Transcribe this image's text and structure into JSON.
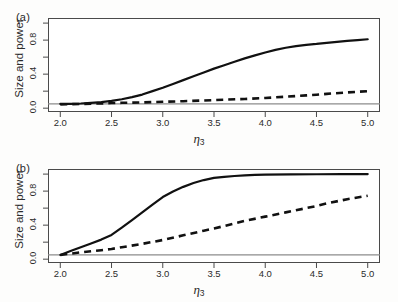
{
  "figure": {
    "background": "#fdfdfc",
    "axis_color": "#4a4a4a",
    "curve_color": "#111111",
    "reference_line_color": "#8c8c8c"
  },
  "chart_data": [
    {
      "type": "line",
      "panel": "(a)",
      "title": "",
      "xlabel": "η₃",
      "ylabel": "Size and power",
      "xlim": [
        1.88,
        5.12
      ],
      "ylim": [
        -0.045,
        1.06
      ],
      "xticks": [
        2.0,
        2.5,
        3.0,
        3.5,
        4.0,
        4.5,
        5.0
      ],
      "xtick_labels": [
        "2.0",
        "2.5",
        "3.0",
        "3.5",
        "4.0",
        "4.5",
        "5.0"
      ],
      "yticks": [
        0.0,
        0.2,
        0.4,
        0.6,
        0.8,
        1.0
      ],
      "ytick_labels": [
        "0.0",
        "",
        "0.4",
        "",
        "0.8",
        ""
      ],
      "grid": false,
      "legend": "none",
      "reference_line_y": 0.05,
      "series": [
        {
          "name": "solid",
          "style": "solid",
          "x": [
            2.0,
            2.1,
            2.2,
            2.3,
            2.4,
            2.5,
            2.6,
            2.7,
            2.8,
            2.9,
            3.0,
            3.1,
            3.2,
            3.3,
            3.4,
            3.5,
            3.6,
            3.7,
            3.8,
            3.9,
            4.0,
            4.1,
            4.2,
            4.3,
            4.4,
            4.5,
            4.6,
            4.7,
            4.8,
            4.9,
            5.0
          ],
          "values": [
            0.05,
            0.05,
            0.055,
            0.063,
            0.072,
            0.085,
            0.105,
            0.13,
            0.16,
            0.2,
            0.24,
            0.285,
            0.33,
            0.375,
            0.42,
            0.465,
            0.505,
            0.545,
            0.585,
            0.62,
            0.655,
            0.685,
            0.71,
            0.73,
            0.745,
            0.755,
            0.768,
            0.78,
            0.79,
            0.8,
            0.81
          ]
        },
        {
          "name": "dashed",
          "style": "dashed",
          "x": [
            2.0,
            2.2,
            2.4,
            2.5,
            2.6,
            2.8,
            3.0,
            3.2,
            3.4,
            3.5,
            3.6,
            3.8,
            4.0,
            4.2,
            4.4,
            4.5,
            4.6,
            4.8,
            5.0
          ],
          "values": [
            0.045,
            0.05,
            0.056,
            0.06,
            0.063,
            0.068,
            0.075,
            0.082,
            0.09,
            0.095,
            0.1,
            0.108,
            0.12,
            0.135,
            0.15,
            0.158,
            0.168,
            0.185,
            0.2
          ]
        }
      ]
    },
    {
      "type": "line",
      "panel": "(b)",
      "title": "",
      "xlabel": "η₃",
      "ylabel": "Size and power",
      "xlim": [
        1.88,
        5.12
      ],
      "ylim": [
        -0.045,
        1.06
      ],
      "xticks": [
        2.0,
        2.5,
        3.0,
        3.5,
        4.0,
        4.5,
        5.0
      ],
      "xtick_labels": [
        "2.0",
        "2.5",
        "3.0",
        "3.5",
        "4.0",
        "4.5",
        "5.0"
      ],
      "yticks": [
        0.0,
        0.2,
        0.4,
        0.6,
        0.8,
        1.0
      ],
      "ytick_labels": [
        "0.0",
        "",
        "0.4",
        "",
        "0.8",
        ""
      ],
      "grid": false,
      "legend": "none",
      "reference_line_y": 0.05,
      "series": [
        {
          "name": "solid",
          "style": "solid",
          "x": [
            2.0,
            2.1,
            2.2,
            2.3,
            2.4,
            2.5,
            2.6,
            2.7,
            2.8,
            2.9,
            3.0,
            3.1,
            3.2,
            3.3,
            3.4,
            3.5,
            3.6,
            3.7,
            3.8,
            3.9,
            4.0,
            4.25,
            4.5,
            4.75,
            5.0
          ],
          "values": [
            0.05,
            0.095,
            0.14,
            0.185,
            0.23,
            0.285,
            0.37,
            0.46,
            0.55,
            0.64,
            0.73,
            0.795,
            0.85,
            0.895,
            0.93,
            0.955,
            0.968,
            0.978,
            0.985,
            0.99,
            0.993,
            0.996,
            0.998,
            0.999,
            1.0
          ]
        },
        {
          "name": "dashed",
          "style": "dashed",
          "x": [
            2.0,
            2.2,
            2.4,
            2.5,
            2.6,
            2.8,
            3.0,
            3.2,
            3.4,
            3.5,
            3.6,
            3.8,
            4.0,
            4.2,
            4.4,
            4.5,
            4.6,
            4.8,
            5.0
          ],
          "values": [
            0.05,
            0.08,
            0.105,
            0.12,
            0.14,
            0.18,
            0.225,
            0.28,
            0.335,
            0.36,
            0.39,
            0.45,
            0.5,
            0.55,
            0.6,
            0.625,
            0.655,
            0.705,
            0.745
          ]
        }
      ]
    }
  ]
}
